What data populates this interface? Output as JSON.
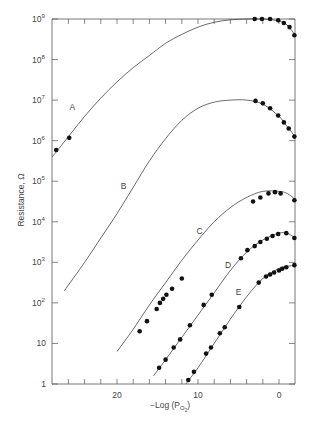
{
  "chart_data": {
    "type": "scatter",
    "title": "",
    "xlabel": "−Log (P",
    "xlabel_sub": "O",
    "xlabel_subsub": "2",
    "xlabel_close": ")",
    "ylabel": "Resistance, Ω",
    "xlim": [
      28,
      -2
    ],
    "x_reversed": true,
    "ylim_log10": [
      0,
      9
    ],
    "yscale": "log",
    "grid": false,
    "legend": "none",
    "x_ticks": [
      26,
      24,
      22,
      20,
      18,
      16,
      14,
      12,
      10,
      8,
      6,
      4,
      2,
      0
    ],
    "x_tick_labels": [
      {
        "value": 20,
        "text": "20"
      },
      {
        "value": 10,
        "text": "10"
      },
      {
        "value": 0,
        "text": "0"
      }
    ],
    "y_tick_labels": [
      {
        "exp": 0,
        "text": "1",
        "sup": ""
      },
      {
        "exp": 1,
        "text": "10",
        "sup": ""
      },
      {
        "exp": 2,
        "text": "10",
        "sup": "2"
      },
      {
        "exp": 3,
        "text": "10",
        "sup": "3"
      },
      {
        "exp": 4,
        "text": "10",
        "sup": "4"
      },
      {
        "exp": 5,
        "text": "10",
        "sup": "5"
      },
      {
        "exp": 6,
        "text": "10",
        "sup": "6"
      },
      {
        "exp": 7,
        "text": "10",
        "sup": "7"
      },
      {
        "exp": 8,
        "text": "10",
        "sup": "8"
      },
      {
        "exp": 9,
        "text": "10",
        "sup": "9"
      }
    ],
    "series": [
      {
        "name": "A",
        "label_at": {
          "x": 25.5,
          "log10R": 6.75
        },
        "curve": [
          [
            28,
            5.6
          ],
          [
            26,
            6.1
          ],
          [
            24,
            6.6
          ],
          [
            22,
            7.05
          ],
          [
            20,
            7.45
          ],
          [
            18,
            7.8
          ],
          [
            16,
            8.1
          ],
          [
            14,
            8.4
          ],
          [
            12,
            8.62
          ],
          [
            10,
            8.8
          ],
          [
            8,
            8.92
          ],
          [
            6,
            8.98
          ],
          [
            4,
            9.0
          ],
          [
            2,
            9.0
          ],
          [
            0,
            8.95
          ],
          [
            -1,
            8.85
          ],
          [
            -2,
            8.6
          ]
        ],
        "points": [
          [
            27.5,
            5.77
          ],
          [
            25.9,
            6.07
          ],
          [
            3.0,
            9.0
          ],
          [
            2.1,
            9.0
          ],
          [
            1.1,
            9.0
          ],
          [
            0.1,
            8.97
          ],
          [
            -0.6,
            8.9
          ],
          [
            -1.3,
            8.8
          ],
          [
            -1.9,
            8.6
          ]
        ]
      },
      {
        "name": "B",
        "label_at": {
          "x": 19.2,
          "log10R": 4.8
        },
        "curve": [
          [
            26.5,
            2.3
          ],
          [
            24,
            3.0
          ],
          [
            22,
            3.6
          ],
          [
            20,
            4.2
          ],
          [
            18,
            4.85
          ],
          [
            16,
            5.5
          ],
          [
            14,
            6.05
          ],
          [
            12,
            6.5
          ],
          [
            10,
            6.8
          ],
          [
            8,
            6.95
          ],
          [
            6,
            7.0
          ],
          [
            4,
            7.0
          ],
          [
            2,
            6.9
          ],
          [
            0,
            6.6
          ],
          [
            -1,
            6.35
          ],
          [
            -2,
            6.1
          ]
        ],
        "points": [
          [
            2.9,
            6.98
          ],
          [
            2.0,
            6.92
          ],
          [
            1.1,
            6.8
          ],
          [
            0.1,
            6.62
          ],
          [
            -0.6,
            6.45
          ],
          [
            -1.2,
            6.3
          ],
          [
            -1.9,
            6.1
          ]
        ]
      },
      {
        "name": "C",
        "label_at": {
          "x": 9.8,
          "log10R": 3.7
        },
        "curve": [
          [
            20,
            0.8
          ],
          [
            18,
            1.35
          ],
          [
            16,
            1.95
          ],
          [
            14,
            2.5
          ],
          [
            12,
            3.05
          ],
          [
            10,
            3.55
          ],
          [
            8,
            4.0
          ],
          [
            6,
            4.35
          ],
          [
            4,
            4.6
          ],
          [
            2,
            4.75
          ],
          [
            0,
            4.75
          ],
          [
            -1,
            4.7
          ],
          [
            -2,
            4.55
          ]
        ],
        "points": [
          [
            17.2,
            1.3
          ],
          [
            16.3,
            1.55
          ],
          [
            15.1,
            1.85
          ],
          [
            14.7,
            2.0
          ],
          [
            14.3,
            2.1
          ],
          [
            13.9,
            2.2
          ],
          [
            13.2,
            2.35
          ],
          [
            12.0,
            2.6
          ],
          [
            3.2,
            4.5
          ],
          [
            2.3,
            4.6
          ],
          [
            1.3,
            4.7
          ],
          [
            0.5,
            4.73
          ],
          [
            -0.2,
            4.7
          ],
          [
            -1.9,
            4.53
          ]
        ]
      },
      {
        "name": "D",
        "label_at": {
          "x": 6.3,
          "log10R": 2.85
        },
        "curve": [
          [
            15.5,
            0.2
          ],
          [
            14,
            0.6
          ],
          [
            12,
            1.15
          ],
          [
            10,
            1.7
          ],
          [
            8,
            2.25
          ],
          [
            6,
            2.8
          ],
          [
            4,
            3.25
          ],
          [
            2,
            3.55
          ],
          [
            0,
            3.72
          ],
          [
            -1,
            3.72
          ],
          [
            -2,
            3.6
          ]
        ],
        "points": [
          [
            14.8,
            0.4
          ],
          [
            14.0,
            0.6
          ],
          [
            13.0,
            0.9
          ],
          [
            12.2,
            1.1
          ],
          [
            11.0,
            1.45
          ],
          [
            9.3,
            1.95
          ],
          [
            8.3,
            2.2
          ],
          [
            4.7,
            3.1
          ],
          [
            3.9,
            3.3
          ],
          [
            3.0,
            3.4
          ],
          [
            2.3,
            3.5
          ],
          [
            1.5,
            3.58
          ],
          [
            0.8,
            3.65
          ],
          [
            0.1,
            3.7
          ],
          [
            -0.9,
            3.72
          ],
          [
            -1.9,
            3.6
          ]
        ]
      },
      {
        "name": "E",
        "label_at": {
          "x": 5.0,
          "log10R": 2.2
        },
        "curve": [
          [
            11.5,
            0.0
          ],
          [
            10,
            0.4
          ],
          [
            8,
            1.0
          ],
          [
            6,
            1.6
          ],
          [
            4,
            2.15
          ],
          [
            2,
            2.6
          ],
          [
            0,
            2.85
          ],
          [
            -1,
            2.9
          ],
          [
            -2,
            2.93
          ]
        ],
        "points": [
          [
            11.2,
            0.1
          ],
          [
            10.5,
            0.3
          ],
          [
            9.0,
            0.75
          ],
          [
            8.4,
            0.9
          ],
          [
            7.3,
            1.25
          ],
          [
            6.7,
            1.4
          ],
          [
            4.9,
            1.9
          ],
          [
            2.5,
            2.5
          ],
          [
            1.6,
            2.65
          ],
          [
            1.1,
            2.7
          ],
          [
            0.6,
            2.75
          ],
          [
            0.0,
            2.8
          ],
          [
            -0.4,
            2.84
          ],
          [
            -0.9,
            2.88
          ],
          [
            -1.9,
            2.93
          ]
        ]
      }
    ]
  }
}
